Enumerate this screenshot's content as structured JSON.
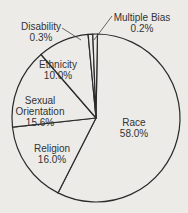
{
  "chart_data": {
    "type": "pie",
    "title": "",
    "categories": [
      "Race",
      "Religion",
      "Sexual Orientation",
      "Ethnicity",
      "Disability",
      "Multiple Bias"
    ],
    "values": [
      58.0,
      16.0,
      15.6,
      10.0,
      0.3,
      0.2
    ],
    "unit": "%",
    "labels": [
      {
        "name": "Race",
        "value": "58.0%"
      },
      {
        "name": "Religion",
        "value": "16.0%"
      },
      {
        "name": "Sexual Orientation",
        "value": "15.6%"
      },
      {
        "name": "Ethnicity",
        "value": "10.0%"
      },
      {
        "name": "Disability",
        "value": "0.3%"
      },
      {
        "name": "Multiple Bias",
        "value": "0.2%"
      }
    ],
    "start_angle": "12 o'clock",
    "direction": "clockwise",
    "fill_color": "#ecebe8",
    "stroke_color": "#2a2a2a",
    "legend": "none (direct labels)"
  },
  "labels": {
    "race": {
      "name": "Race",
      "value": "58.0%"
    },
    "religion": {
      "name": "Religion",
      "value": "16.0%"
    },
    "sexual_orientation": {
      "name1": "Sexual",
      "name2": "Orientation",
      "value": "15.6%"
    },
    "ethnicity": {
      "name": "Ethnicity",
      "value": "10.0%"
    },
    "disability": {
      "name": "Disability",
      "value": "0.3%"
    },
    "multiple_bias": {
      "name": "Multiple Bias",
      "value": "0.2%"
    }
  }
}
